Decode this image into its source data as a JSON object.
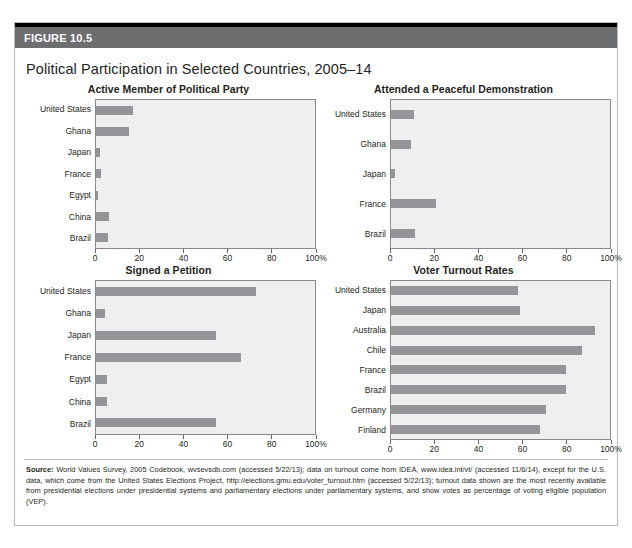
{
  "figure": {
    "label": "FIGURE 10.5",
    "title": "Political Participation in Selected Countries, 2005–14"
  },
  "axis": {
    "ticks": [
      "0",
      "20",
      "40",
      "60",
      "80",
      "100%"
    ],
    "tick_values": [
      0,
      20,
      40,
      60,
      80,
      100
    ]
  },
  "colors": {
    "header_bar": "#6d6e70",
    "top_rule": "#000000",
    "bar_fill": "#939598",
    "plot_background": "#efefef",
    "plot_border": "#8a8a8a",
    "box_border": "#b9b9b9",
    "text": "#231f20"
  },
  "source": {
    "prefix": "Source:",
    "text": " World Values Survey, 2005 Codebook, wvsevsdb.com (accessed 5/22/13); data on turnout come from IDEA, www.idea.int/vt/ (accessed 11/6/14), except for the U.S. data, which come from the United States Elections Project, http://elections.gmu.edu/voter_turnout.htm (accessed 5/22/13); turnout data shown are the most recently available from presidential elections under presidential systems and parliamentary elections under parliamentary systems, and show votes as percentage of voting eligible population (VEP)."
  },
  "chart_data": [
    {
      "type": "bar",
      "orientation": "horizontal",
      "title": "Active Member of Political Party",
      "xlabel": "",
      "ylabel": "",
      "xlim": [
        0,
        100
      ],
      "grid": false,
      "legend": "none",
      "categories": [
        "United States",
        "Ghana",
        "Japan",
        "France",
        "Egypt",
        "China",
        "Brazil"
      ],
      "values": [
        17,
        15,
        2,
        2.5,
        1,
        6,
        5.5
      ],
      "xticks": [
        0,
        20,
        40,
        60,
        80,
        100
      ],
      "xticklabels": [
        "0",
        "20",
        "40",
        "60",
        "80",
        "100%"
      ]
    },
    {
      "type": "bar",
      "orientation": "horizontal",
      "title": "Attended a Peaceful Demonstration",
      "xlabel": "",
      "ylabel": "",
      "xlim": [
        0,
        100
      ],
      "grid": false,
      "legend": "none",
      "categories": [
        "United States",
        "Ghana",
        "Japan",
        "France",
        "Brazil"
      ],
      "values": [
        10.5,
        9,
        2,
        20.5,
        11
      ],
      "xticks": [
        0,
        20,
        40,
        60,
        80,
        100
      ],
      "xticklabels": [
        "0",
        "20",
        "40",
        "60",
        "80",
        "100%"
      ]
    },
    {
      "type": "bar",
      "orientation": "horizontal",
      "title": "Signed a Petition",
      "xlabel": "",
      "ylabel": "",
      "xlim": [
        0,
        100
      ],
      "grid": false,
      "legend": "none",
      "categories": [
        "United States",
        "Ghana",
        "Japan",
        "France",
        "Egypt",
        "China",
        "Brazil"
      ],
      "values": [
        73,
        4,
        55,
        66,
        5,
        5,
        55
      ],
      "xticks": [
        0,
        20,
        40,
        60,
        80,
        100
      ],
      "xticklabels": [
        "0",
        "20",
        "40",
        "60",
        "80",
        "100%"
      ]
    },
    {
      "type": "bar",
      "orientation": "horizontal",
      "title": "Voter Turnout Rates",
      "xlabel": "",
      "ylabel": "",
      "xlim": [
        0,
        100
      ],
      "grid": false,
      "legend": "none",
      "categories": [
        "United States",
        "Japan",
        "Australia",
        "Chile",
        "France",
        "Brazil",
        "Germany",
        "Finland"
      ],
      "values": [
        58,
        59,
        93,
        87,
        80,
        80,
        71,
        68
      ],
      "xticks": [
        0,
        20,
        40,
        60,
        80,
        100
      ],
      "xticklabels": [
        "0",
        "20",
        "40",
        "60",
        "80",
        "100%"
      ]
    }
  ]
}
